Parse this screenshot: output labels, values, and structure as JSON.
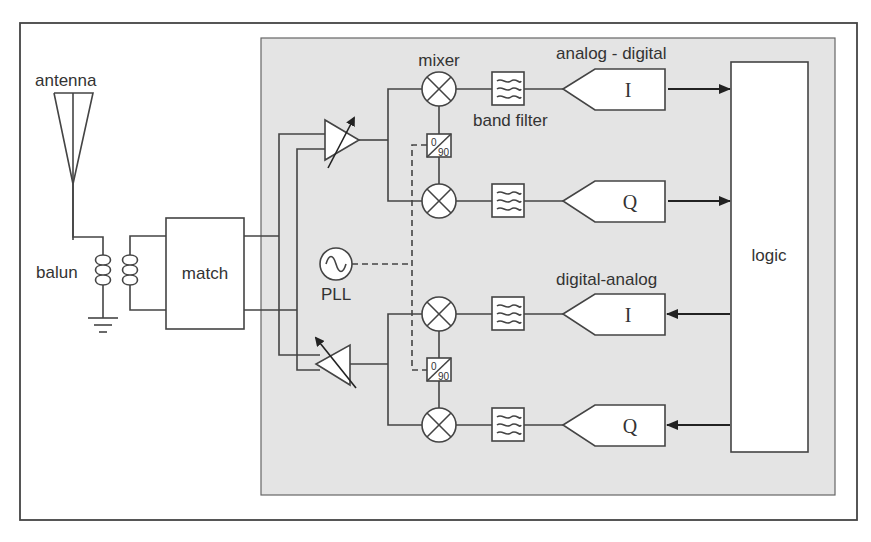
{
  "diagram": {
    "type": "RF transceiver block diagram",
    "colors": {
      "frame": "#444444",
      "panel_fill": "#e4e4e4",
      "block_fill": "#ffffff",
      "line": "#444444",
      "text": "#333333"
    },
    "labels": {
      "antenna": "antenna",
      "balun": "balun",
      "match": "match",
      "pll": "PLL",
      "mixer": "mixer",
      "band_filter": "band filter",
      "adc_group": "analog - digital",
      "dac_group": "digital-analog",
      "logic": "logic",
      "adc_i": "I",
      "adc_q": "Q",
      "dac_i": "I",
      "dac_q": "Q",
      "phase_shift_top_0": "0",
      "phase_shift_top_90": "90",
      "phase_shift_bottom_0": "0",
      "phase_shift_bottom_90": "90"
    },
    "chains": [
      {
        "name": "receive",
        "paths": [
          "I",
          "Q"
        ],
        "converter": "analog - digital",
        "direction": "to logic"
      },
      {
        "name": "transmit",
        "paths": [
          "I",
          "Q"
        ],
        "converter": "digital-analog",
        "direction": "from logic"
      }
    ]
  }
}
